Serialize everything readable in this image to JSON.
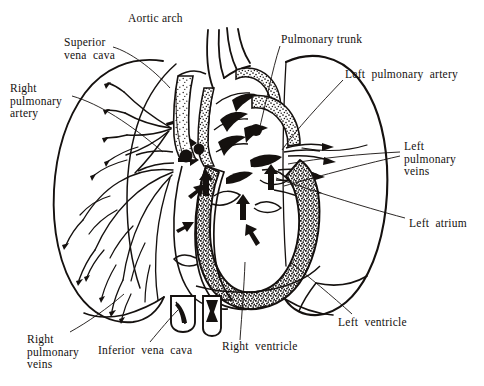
{
  "figure": {
    "background_color": "#ffffff",
    "ink_color": "#15110f",
    "style": "black-and-white line engraving with stippled shading"
  },
  "labels": {
    "aortic_arch": "Aortic arch",
    "superior_vena_cava_l1": "Superior",
    "superior_vena_cava_l2": "vena  cava",
    "right_pulmonary_artery_l1": "Right",
    "right_pulmonary_artery_l2": "pulmonary",
    "right_pulmonary_artery_l3": "artery",
    "pulmonary_trunk": "Pulmonary trunk",
    "left_pulmonary_artery": "Left  pulmonary  artery",
    "left_pulmonary_veins_l1": "Left",
    "left_pulmonary_veins_l2": "pulmonary",
    "left_pulmonary_veins_l3": "veins",
    "left_atrium": "Left  atrium",
    "left_ventricle": "Left  ventricle",
    "right_ventricle": "Right  ventricle",
    "inferior_vena_cava": "Inferior  vena  cava",
    "right_pulmonary_veins_l1": "Right",
    "right_pulmonary_veins_l2": "pulmonary",
    "right_pulmonary_veins_l3": "veins"
  },
  "structures": [
    "right lung with branching pulmonary vascular tree",
    "left lung outline with oblique fissure",
    "aortic arch with brachiocephalic, left common carotid and left subclavian branches",
    "superior vena cava",
    "inferior vena cava stump",
    "pulmonary trunk",
    "right atrium",
    "right ventricle",
    "left atrium",
    "left ventricle with thick stippled myocardium",
    "interventricular septum",
    "atrioventricular valve cusps",
    "blood flow arrows"
  ]
}
